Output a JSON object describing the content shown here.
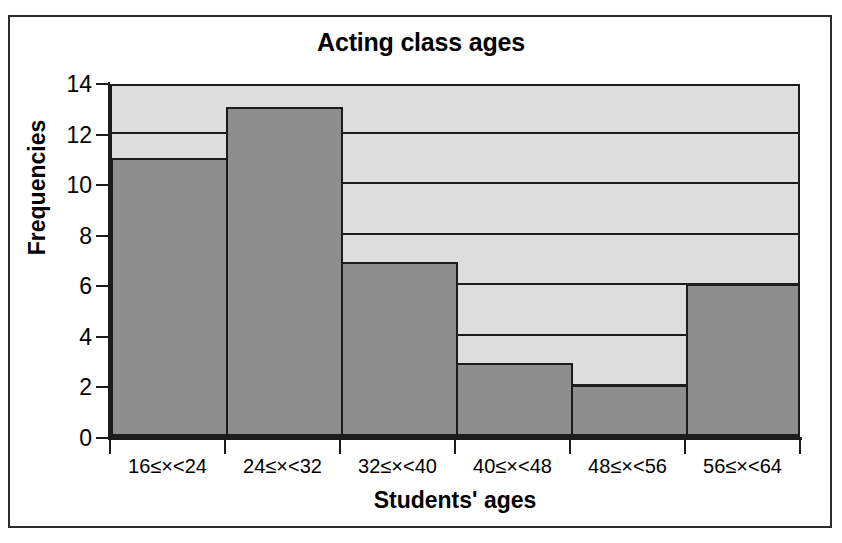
{
  "chart_data": {
    "type": "bar",
    "title": "Acting class ages",
    "xlabel": "Students' ages",
    "ylabel": "Frequencies",
    "categories": [
      "16≤×<24",
      "24≤×<32",
      "32≤×<40",
      "40≤×<48",
      "48≤×<56",
      "56≤×<64"
    ],
    "values": [
      11,
      13,
      6.9,
      2.9,
      2,
      6
    ],
    "ylim": [
      0,
      14
    ],
    "yticks": [
      0,
      2,
      4,
      6,
      8,
      10,
      12,
      14
    ],
    "ytick_labels": [
      "0",
      "2",
      "4",
      "6",
      "8",
      "10",
      "12",
      "14"
    ],
    "grid": true,
    "grid_axis": "y",
    "legend": false,
    "bar_color": "#8e8e8e",
    "bar_edge_color": "#1c1c1c",
    "plot_background": "#dddddd",
    "figure_background": "#ffffff",
    "frame_color": "#2b2b2b"
  }
}
